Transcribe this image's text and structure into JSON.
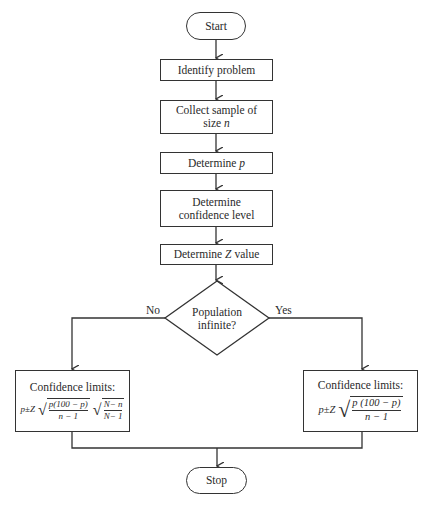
{
  "diagram": {
    "type": "flowchart",
    "nodes": {
      "start": "Start",
      "identify": "Identify problem",
      "collect_line1": "Collect sample of",
      "collect_line2_prefix": "size ",
      "collect_var": "n",
      "determine_p_prefix": "Determine ",
      "determine_p_var": "p",
      "confidence_line1": "Determine",
      "confidence_line2": "confidence level",
      "z_prefix": "Determine ",
      "z_var": "Z",
      "z_suffix": " value",
      "decision_line1": "Population",
      "decision_line2": "infinite?",
      "stop": "Stop"
    },
    "branches": {
      "no": "No",
      "yes": "Yes"
    },
    "left_box": {
      "title": "Confidence limits:",
      "p": "p",
      "pm": " ± ",
      "z": "Z",
      "num": "p(100 − p)",
      "den": "n − 1",
      "num2": "N− n",
      "den2": "N− 1"
    },
    "right_box": {
      "title": "Confidence limits:",
      "p": "p",
      "pm": " ± ",
      "z": "Z",
      "num": "p (100 − p)",
      "den": "n − 1"
    },
    "edges": [
      [
        "Start",
        "Identify problem"
      ],
      [
        "Identify problem",
        "Collect sample of size n"
      ],
      [
        "Collect sample of size n",
        "Determine p"
      ],
      [
        "Determine p",
        "Determine confidence level"
      ],
      [
        "Determine confidence level",
        "Determine Z value"
      ],
      [
        "Determine Z value",
        "Population infinite?"
      ],
      [
        "Population infinite?",
        "Confidence limits (finite)",
        "No"
      ],
      [
        "Population infinite?",
        "Confidence limits (infinite)",
        "Yes"
      ],
      [
        "Confidence limits (finite)",
        "Stop"
      ],
      [
        "Confidence limits (infinite)",
        "Stop"
      ]
    ]
  }
}
